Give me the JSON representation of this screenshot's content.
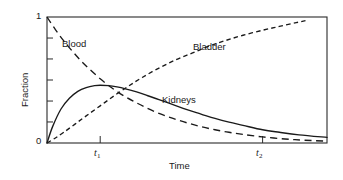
{
  "chart_data": {
    "type": "line",
    "title": "",
    "xlabel": "Time",
    "ylabel": "Fraction",
    "xlim": [
      0,
      1
    ],
    "ylim": [
      0,
      1
    ],
    "grid": false,
    "legend": "inline-curve-labels",
    "y_ticks": {
      "labeled": [
        "0",
        "1"
      ],
      "labeled_values": [
        0,
        1
      ],
      "minor_count": 5,
      "minor_values": [
        0.167,
        0.333,
        0.5,
        0.667,
        0.833
      ]
    },
    "x_ticks": {
      "labeled": [
        "t1",
        "t2"
      ],
      "labeled_values": [
        0.19,
        0.77
      ]
    },
    "annotations": [
      {
        "text": "Blood",
        "x": 0.09,
        "y": 0.83
      },
      {
        "text": "Bladder",
        "x": 0.55,
        "y": 0.8
      },
      {
        "text": "Kidneys",
        "x": 0.43,
        "y": 0.38
      }
    ],
    "series": [
      {
        "name": "Blood",
        "style": "long-dashed",
        "color": "#1a1a1a",
        "description": "Exponential decay from 1 at time 0 toward 0",
        "x": [
          0,
          0.03,
          0.06,
          0.09,
          0.12,
          0.15,
          0.19,
          0.23,
          0.27,
          0.31,
          0.35,
          0.4,
          0.45,
          0.5,
          0.55,
          0.6,
          0.65,
          0.7,
          0.77,
          0.85,
          0.92,
          1.0
        ],
        "y": [
          1.0,
          0.9,
          0.81,
          0.73,
          0.655,
          0.59,
          0.51,
          0.44,
          0.38,
          0.33,
          0.285,
          0.235,
          0.195,
          0.16,
          0.13,
          0.105,
          0.085,
          0.068,
          0.048,
          0.032,
          0.022,
          0.015
        ]
      },
      {
        "name": "Kidneys",
        "style": "solid",
        "color": "#1a1a1a",
        "description": "Rises from 0 to a peak near t1 then decays slowly",
        "x": [
          0,
          0.02,
          0.05,
          0.08,
          0.11,
          0.14,
          0.17,
          0.19,
          0.22,
          0.25,
          0.28,
          0.32,
          0.36,
          0.4,
          0.45,
          0.5,
          0.55,
          0.6,
          0.65,
          0.7,
          0.77,
          0.83,
          0.9,
          1.0
        ],
        "y": [
          0,
          0.13,
          0.27,
          0.355,
          0.41,
          0.44,
          0.455,
          0.458,
          0.455,
          0.445,
          0.43,
          0.405,
          0.375,
          0.345,
          0.305,
          0.265,
          0.23,
          0.195,
          0.165,
          0.14,
          0.105,
          0.085,
          0.065,
          0.045
        ]
      },
      {
        "name": "Bladder",
        "style": "short-dashed",
        "color": "#1a1a1a",
        "description": "Saturating rise from 0 approaching 1",
        "x": [
          0,
          0.03,
          0.06,
          0.1,
          0.14,
          0.19,
          0.24,
          0.29,
          0.34,
          0.4,
          0.46,
          0.52,
          0.58,
          0.64,
          0.7,
          0.77,
          0.83,
          0.89,
          0.93
        ],
        "y": [
          0,
          0.04,
          0.085,
          0.15,
          0.215,
          0.295,
          0.375,
          0.45,
          0.52,
          0.595,
          0.66,
          0.715,
          0.77,
          0.815,
          0.855,
          0.895,
          0.925,
          0.955,
          0.975
        ]
      }
    ]
  },
  "axis": {
    "y_top_label": "1",
    "y_bottom_label": "0",
    "y_title": "Fraction",
    "x_title": "Time",
    "x_tick1_letter": "t",
    "x_tick1_sub": "1",
    "x_tick2_letter": "t",
    "x_tick2_sub": "2"
  },
  "labels": {
    "blood": "Blood",
    "bladder": "Bladder",
    "kidneys": "Kidneys"
  },
  "colors": {
    "ink": "#1a1a1a",
    "frame": "#2b2b2b",
    "background": "#ffffff"
  }
}
